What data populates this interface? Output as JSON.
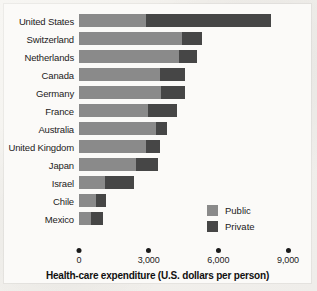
{
  "chart_data": {
    "type": "bar",
    "orientation": "horizontal",
    "stacked": true,
    "title": "",
    "xlabel": "Health-care expenditure (U.S. dollars per person)",
    "ylabel": "",
    "xlim": [
      0,
      9000
    ],
    "xticks": [
      0,
      3000,
      6000,
      9000
    ],
    "xticklabels": [
      "0",
      "3,000",
      "6,000",
      "9,000"
    ],
    "grid": false,
    "legend_position": "inside-bottom-right",
    "categories": [
      "United States",
      "Switzerland",
      "Netherlands",
      "Canada",
      "Germany",
      "France",
      "Australia",
      "United Kingdom",
      "Japan",
      "Israel",
      "Chile",
      "Mexico"
    ],
    "series": [
      {
        "name": "Public",
        "color": "#8a8a8a",
        "values": [
          2900,
          4450,
          4300,
          3500,
          3550,
          2950,
          3300,
          2900,
          2450,
          1100,
          750,
          500
        ]
      },
      {
        "name": "Private",
        "color": "#464646",
        "values": [
          5350,
          850,
          800,
          1050,
          1000,
          1250,
          500,
          600,
          950,
          1250,
          400,
          550
        ]
      }
    ],
    "totals": [
      8250,
      5300,
      5100,
      4550,
      4550,
      4200,
      3800,
      3500,
      3400,
      2350,
      1150,
      1050
    ]
  },
  "legend": {
    "items": [
      {
        "label": "Public",
        "color": "#8a8a8a"
      },
      {
        "label": "Private",
        "color": "#464646"
      }
    ]
  },
  "axis": {
    "title": "Health-care expenditure (U.S. dollars per person)",
    "ticks": [
      "0",
      "3,000",
      "6,000",
      "9,000"
    ]
  }
}
